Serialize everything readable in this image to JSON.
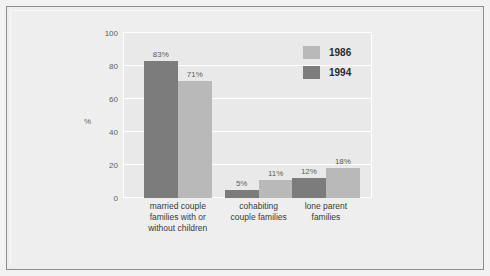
{
  "chart_data": {
    "type": "bar",
    "title": "",
    "subtitle": "",
    "xlabel": "",
    "ylabel": "%",
    "ylim": [
      0,
      100
    ],
    "yticks": [
      0,
      20,
      40,
      60,
      80,
      100
    ],
    "ytick_labels": [
      "0",
      "20",
      "40",
      "60",
      "80",
      "100"
    ],
    "grid": true,
    "legend_position": "top-right",
    "categories": [
      "married couple families with or without children",
      "cohabiting couple families",
      "lone parent families"
    ],
    "category_lines": [
      [
        "married couple",
        "families with or",
        "without children"
      ],
      [
        "cohabiting",
        "couple families"
      ],
      [
        "lone parent",
        "families"
      ]
    ],
    "series": [
      {
        "name": "1986",
        "color": "#b9b9b9",
        "values": [
          71,
          11,
          18
        ],
        "value_labels": [
          "71%",
          "11%",
          "18%"
        ]
      },
      {
        "name": "1994",
        "color": "#7c7c7c",
        "values": [
          83,
          5,
          12
        ],
        "value_labels": [
          "83%",
          "5%",
          "12%"
        ]
      }
    ],
    "series_draw_order": [
      "1994",
      "1986"
    ]
  },
  "legend": {
    "entries": [
      {
        "label": "1986",
        "color": "#b9b9b9"
      },
      {
        "label": "1994",
        "color": "#7c7c7c"
      }
    ]
  },
  "colors": {
    "page_background": "#eeeeee",
    "plot_background": "#e9e9e9",
    "gridline": "#ffffff",
    "border": "#8d8d8d",
    "tick_text": "#5e5e5e",
    "label_text": "#3a3a3a",
    "series_1986": "#b9b9b9",
    "series_1994": "#7c7c7c"
  }
}
